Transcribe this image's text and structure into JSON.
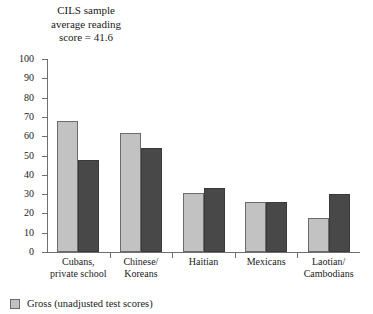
{
  "caption": {
    "line1": "CILS sample",
    "line2": "average reading",
    "line3": "score = 41.6"
  },
  "legend": {
    "items": [
      {
        "label": "Gross (unadjusted test scores)",
        "color": "#c2c2c2",
        "swatch_name": "legend-swatch-gross"
      }
    ]
  },
  "colors": {
    "series_gross": "#c2c2c2",
    "series_dark": "#484848",
    "axis": "#6e6e6e",
    "background": "#ffffff"
  },
  "chart_data": {
    "type": "bar",
    "title": "",
    "xlabel": "",
    "ylabel": "",
    "ylim": [
      0,
      100
    ],
    "yticks": [
      0,
      10,
      20,
      30,
      40,
      50,
      60,
      70,
      80,
      90,
      100
    ],
    "grid": false,
    "legend_position": "bottom-left",
    "categories": [
      "Cubans,\nprivate school",
      "Chinese/\nKoreans",
      "Haitian",
      "Mexicans",
      "Laotian/\nCambodians"
    ],
    "category_lines": [
      [
        "Cubans,",
        "private school"
      ],
      [
        "Chinese/",
        "Koreans"
      ],
      [
        "Haitian",
        ""
      ],
      [
        "Mexicans",
        ""
      ],
      [
        "Laotian/",
        "Cambodians"
      ]
    ],
    "series": [
      {
        "name": "Gross (unadjusted test scores)",
        "color": "#c2c2c2",
        "values": [
          68,
          61.5,
          30.5,
          26,
          17.5
        ]
      },
      {
        "name": "Adjusted",
        "color": "#484848",
        "values": [
          47.5,
          54,
          33,
          26,
          30
        ]
      }
    ],
    "reference_note": "CILS sample average reading score = 41.6",
    "reference_value": 41.6
  }
}
